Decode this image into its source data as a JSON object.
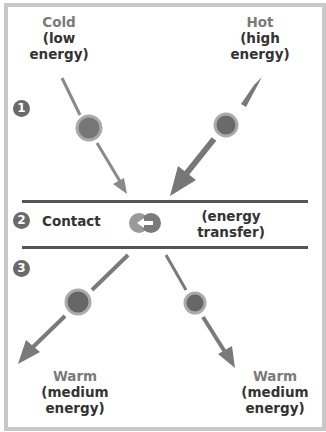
{
  "labels": {
    "cold": {
      "title": "Cold",
      "line1": "(low",
      "line2": "energy)"
    },
    "hot": {
      "title": "Hot",
      "line1": "(high",
      "line2": "energy)"
    },
    "warm_left": {
      "title": "Warm",
      "line1": "(medium",
      "line2": "energy)"
    },
    "warm_right": {
      "title": "Warm",
      "line1": "(medium",
      "line2": "energy)"
    }
  },
  "steps": [
    "1",
    "2",
    "3"
  ],
  "contact": {
    "label": "Contact",
    "transfer_line1": "(energy",
    "transfer_line2": "transfer)"
  },
  "colors": {
    "frame": "#c8c8c8",
    "arrow": "#7a7a7a",
    "particle": "#8a8a8a",
    "line": "#555555",
    "title_gray": "#7a7a7a",
    "text": "#333333"
  }
}
